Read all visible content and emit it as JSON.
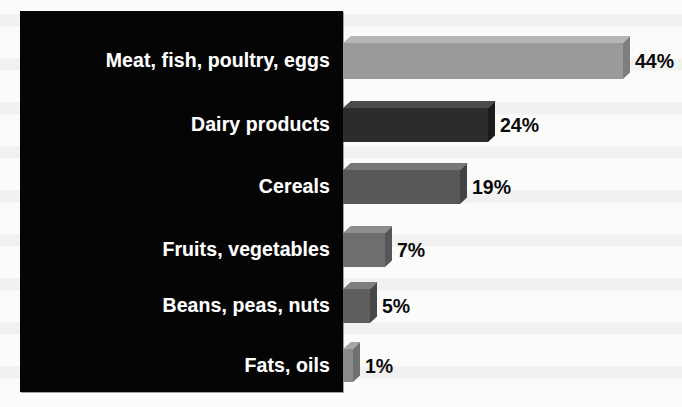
{
  "figure": {
    "background_color": "#fbfbfa",
    "panel_color": "#050505",
    "label_text_color": "#ffffff",
    "value_text_color": "#0b0b0b"
  },
  "chart_data": {
    "type": "bar",
    "orientation": "horizontal",
    "title": "",
    "subtitle": "",
    "xlabel": "",
    "ylabel": "",
    "xlim": [
      0,
      44
    ],
    "grid": false,
    "legend": null,
    "value_suffix": "%",
    "categories": [
      "Meat, fish, poultry, eggs",
      "Dairy products",
      "Cereals",
      "Fruits, vegetables",
      "Beans, peas, nuts",
      "Fats, oils"
    ],
    "values": [
      44,
      24,
      19,
      7,
      5,
      1
    ],
    "value_labels": [
      "44%",
      "24%",
      "19%",
      "7%",
      "5%",
      "1%"
    ],
    "bar_colors": [
      "#9a9a9a",
      "#2c2c2c",
      "#585858",
      "#6e6e6e",
      "#5f5f5f",
      "#8a8a8a"
    ],
    "bar_top_colors": [
      "#b6b6b6",
      "#4a4a4a",
      "#777777",
      "#8d8d8d",
      "#7e7e7e",
      "#a6a6a6"
    ],
    "bar_side_colors": [
      "#7e7e7e",
      "#1c1c1c",
      "#434343",
      "#565656",
      "#484848",
      "#6f6f6f"
    ]
  },
  "rows": [
    {
      "label": "Meat, fish, poultry, eggs",
      "value": 44,
      "value_label": "44%",
      "bar_px": 280,
      "bar_height_px": 36,
      "top_px": 36,
      "face_color": "#9a9a9a",
      "top_color": "#b6b6b6",
      "side_color": "#7e7e7e"
    },
    {
      "label": "Dairy products",
      "value": 24,
      "value_label": "24%",
      "bar_px": 145,
      "bar_height_px": 34,
      "top_px": 101,
      "face_color": "#2c2c2c",
      "top_color": "#4a4a4a",
      "side_color": "#1c1c1c"
    },
    {
      "label": "Cereals",
      "value": 19,
      "value_label": "19%",
      "bar_px": 117,
      "bar_height_px": 34,
      "top_px": 163,
      "face_color": "#585858",
      "top_color": "#777777",
      "side_color": "#434343"
    },
    {
      "label": "Fruits, vegetables",
      "value": 7,
      "value_label": "7%",
      "bar_px": 42,
      "bar_height_px": 34,
      "top_px": 226,
      "face_color": "#6e6e6e",
      "top_color": "#8d8d8d",
      "side_color": "#565656"
    },
    {
      "label": "Beans, peas, nuts",
      "value": 5,
      "value_label": "5%",
      "bar_px": 27,
      "bar_height_px": 34,
      "top_px": 282,
      "face_color": "#5f5f5f",
      "top_color": "#7e7e7e",
      "side_color": "#484848"
    },
    {
      "label": "Fats, oils",
      "value": 1,
      "value_label": "1%",
      "bar_px": 10,
      "bar_height_px": 33,
      "top_px": 342,
      "face_color": "#8a8a8a",
      "top_color": "#a6a6a6",
      "side_color": "#6f6f6f"
    }
  ]
}
